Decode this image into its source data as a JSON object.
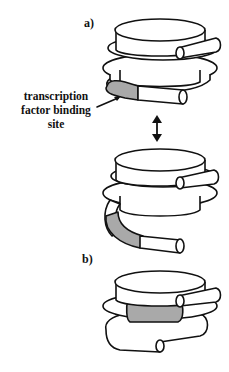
{
  "figure": {
    "panels": [
      {
        "id": "a",
        "label": "a)"
      },
      {
        "id": "b",
        "label": "b)"
      }
    ],
    "annotation": {
      "lines": [
        "transcription",
        "factor binding",
        "site"
      ]
    },
    "colors": {
      "background": "#ffffff",
      "outline": "#111111",
      "binding_site_fill": "#a9a9a9"
    },
    "arrow": {
      "type": "double-headed-vertical"
    }
  }
}
